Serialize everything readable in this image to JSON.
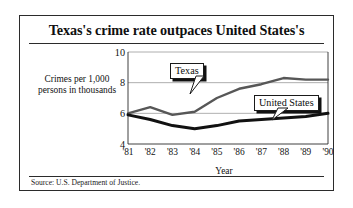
{
  "figure": {
    "title": "Texas's crime rate outpaces United States's",
    "source": "Source: U.S. Department of Justice.",
    "y_axis_caption": "Crimes per 1,000 persons in thousands"
  },
  "callouts": {
    "texas": "Texas",
    "united_states": "United States"
  },
  "colors": {
    "frame": "#2b2b2b",
    "texas_line": "#575757",
    "united_states_line": "#111111",
    "grid": "#9a9a9a",
    "text": "#121212",
    "background": "#ffffff"
  },
  "chart_data": {
    "type": "line",
    "title": "Texas's crime rate outpaces United States's",
    "xlabel": "Year",
    "ylabel": "Crimes per 1,000 persons in thousands",
    "categories": [
      "'81",
      "'82",
      "'83",
      "'84",
      "'85",
      "'86",
      "'87",
      "'88",
      "'89",
      "'90"
    ],
    "ylim": [
      4,
      10
    ],
    "yticks": [
      4,
      6,
      8,
      10
    ],
    "grid": true,
    "legend": "callouts-on-plot",
    "series": [
      {
        "name": "Texas",
        "color": "#575757",
        "values": [
          6.0,
          6.4,
          5.9,
          6.1,
          7.0,
          7.6,
          7.9,
          8.3,
          8.2,
          8.2
        ]
      },
      {
        "name": "United States",
        "color": "#111111",
        "values": [
          5.9,
          5.6,
          5.2,
          5.0,
          5.2,
          5.5,
          5.6,
          5.7,
          5.8,
          6.0
        ]
      }
    ]
  }
}
